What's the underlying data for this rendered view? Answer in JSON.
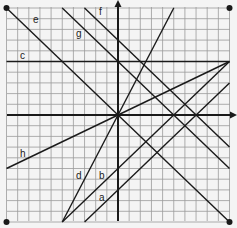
{
  "figure": {
    "type": "coordinate-grid-lines",
    "grid": {
      "xmin": -10,
      "xmax": 10,
      "ymin": -10,
      "ymax": 10,
      "step": 1
    },
    "corner_points": [
      [
        -10,
        10
      ],
      [
        10,
        10
      ],
      [
        -10,
        -10
      ],
      [
        10,
        -10
      ]
    ],
    "lines": [
      {
        "label": "a",
        "from": [
          -3,
          -10
        ],
        "to": [
          10,
          3
        ],
        "equation": "y = x - 7"
      },
      {
        "label": "b",
        "from": [
          -5,
          -10
        ],
        "to": [
          10,
          5
        ],
        "equation": "y = x - 5"
      },
      {
        "label": "c",
        "from": [
          -10,
          5
        ],
        "to": [
          10,
          5
        ],
        "equation": "y = 5"
      },
      {
        "label": "d",
        "from": [
          -5,
          -10
        ],
        "to": [
          5,
          10
        ],
        "equation": "y = 2x"
      },
      {
        "label": "e",
        "from": [
          -10,
          10
        ],
        "to": [
          10,
          -10
        ],
        "equation": "y = -x"
      },
      {
        "label": "f",
        "from": [
          -3,
          10
        ],
        "to": [
          10,
          -3
        ],
        "equation": "y = -x + 7"
      },
      {
        "label": "g",
        "from": [
          -5,
          10
        ],
        "to": [
          10,
          -5
        ],
        "equation": "y = -x + 5"
      },
      {
        "label": "h",
        "from": [
          -10,
          -5
        ],
        "to": [
          10,
          5
        ],
        "equation": "y = x/2"
      }
    ],
    "labels": [
      {
        "text": "e",
        "px": [
          33,
          23
        ]
      },
      {
        "text": "f",
        "px": [
          99,
          15
        ]
      },
      {
        "text": "g",
        "px": [
          76,
          37
        ]
      },
      {
        "text": "c",
        "px": [
          20,
          59
        ]
      },
      {
        "text": "h",
        "px": [
          20,
          157
        ]
      },
      {
        "text": "d",
        "px": [
          76,
          179
        ]
      },
      {
        "text": "b",
        "px": [
          99,
          179
        ]
      },
      {
        "text": "a",
        "px": [
          99,
          201
        ]
      }
    ],
    "colors": {
      "grid": "#9a9a9a",
      "line": "#1a1a1a",
      "background": "#f4f4f4"
    }
  }
}
